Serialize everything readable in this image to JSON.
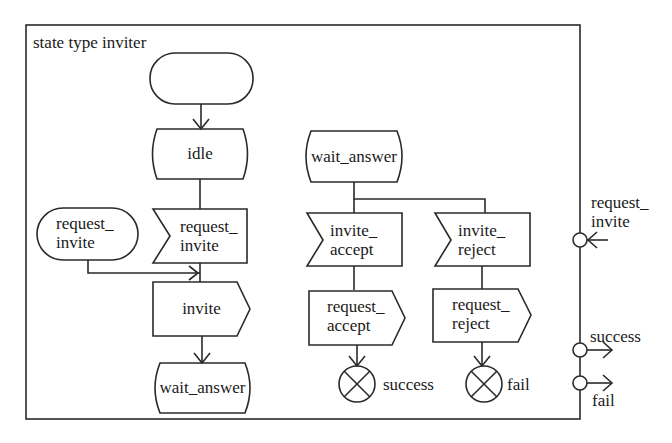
{
  "diagram": {
    "title": "state type inviter",
    "stroke_color": "#2a2a2a",
    "background": "#ffffff",
    "left_flow": {
      "start": "",
      "idle_state": "idle",
      "input_request_invite": "request_\ninvite",
      "external_request_invite": "request_\ninvite",
      "output_invite": "invite",
      "next_state": "wait_answer"
    },
    "right_flow": {
      "state": "wait_answer",
      "input_accept": "invite_\naccept",
      "input_reject": "invite_\nreject",
      "output_accept": "request_\naccept",
      "output_reject": "request_\nreject",
      "exit_success": "success",
      "exit_fail": "fail"
    },
    "ports": {
      "in_request_invite": "request_\ninvite",
      "out_success": "success",
      "out_fail": "fail"
    }
  }
}
